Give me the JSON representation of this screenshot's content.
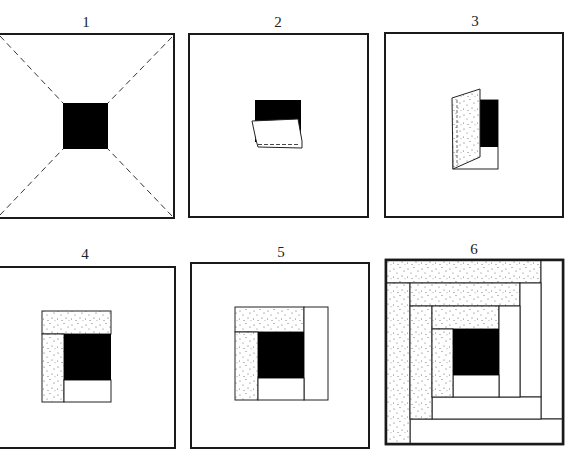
{
  "diagram": {
    "colors": {
      "ink": "#1a1a1a",
      "background": "#ffffff",
      "center": "#000000",
      "stipple_dot": "#555555"
    },
    "panels": [
      {
        "step": 1,
        "label": "1",
        "description": "Foundation square with diagonal fold lines (dashed) and black center square"
      },
      {
        "step": 2,
        "label": "2",
        "description": "First light strip placed face down over the center and stitched along the bottom"
      },
      {
        "step": 3,
        "label": "3",
        "description": "First dark (stippled) strip folded over on the left side"
      },
      {
        "step": 4,
        "label": "4",
        "description": "Center with light strip below, dark strips on left and top"
      },
      {
        "step": 5,
        "label": "5",
        "description": "Light strip added on the right side, completing first round"
      },
      {
        "step": 6,
        "label": "6",
        "description": "Completed log cabin block: dark strips on top/left, light strips on bottom/right"
      }
    ]
  }
}
